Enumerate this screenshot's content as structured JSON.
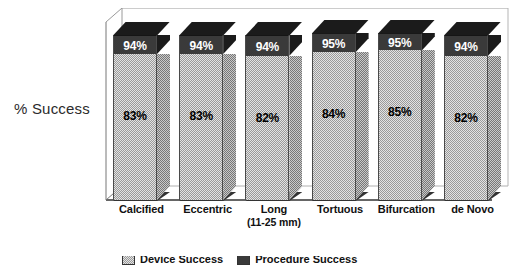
{
  "chart_data": {
    "type": "bar",
    "subtype": "stacked-column-3d",
    "title": "",
    "xlabel": "",
    "ylabel": "% Success",
    "ylim": [
      0,
      100
    ],
    "grid": false,
    "legend_position": "bottom",
    "categories": [
      "Calcified",
      "Eccentric",
      "Long",
      "Tortuous",
      "Bifurcation",
      "de Novo"
    ],
    "category_sublabels": [
      "",
      "",
      "(11-25 mm)",
      "",
      "",
      ""
    ],
    "series": [
      {
        "name": "Device Success",
        "values": [
          83,
          83,
          82,
          84,
          85,
          82
        ],
        "labels": [
          "83%",
          "83%",
          "82%",
          "84%",
          "85%",
          "82%"
        ],
        "color": "#e3e3e3"
      },
      {
        "name": "Procedure Success",
        "values": [
          94,
          94,
          94,
          95,
          95,
          94
        ],
        "labels": [
          "94%",
          "94%",
          "94%",
          "95%",
          "95%",
          "94%"
        ],
        "color": "#3a3a3a"
      }
    ],
    "legend_entries": [
      "Device Success",
      "Procedure Success"
    ]
  },
  "axis": {
    "y_title": "% Success"
  },
  "bars": [
    {
      "category": "Calcified",
      "sublabel": "",
      "low_label": "83%",
      "high_label": "94%",
      "low_value": 83,
      "high_value": 94
    },
    {
      "category": "Eccentric",
      "sublabel": "",
      "low_label": "83%",
      "high_label": "94%",
      "low_value": 83,
      "high_value": 94
    },
    {
      "category": "Long",
      "sublabel": "(11-25 mm)",
      "low_label": "82%",
      "high_label": "94%",
      "low_value": 82,
      "high_value": 94
    },
    {
      "category": "Tortuous",
      "sublabel": "",
      "low_label": "84%",
      "high_label": "95%",
      "low_value": 84,
      "high_value": 95
    },
    {
      "category": "Bifurcation",
      "sublabel": "",
      "low_label": "85%",
      "high_label": "95%",
      "low_value": 85,
      "high_value": 95
    },
    {
      "category": "de Novo",
      "sublabel": "",
      "low_label": "82%",
      "high_label": "94%",
      "low_value": 82,
      "high_value": 94
    }
  ],
  "colors": {
    "segment_low": "#e3e3e3",
    "segment_high": "#3a3a3a",
    "top_cap": "#1b1b1b",
    "frame": "#888888",
    "text": "#111111"
  }
}
